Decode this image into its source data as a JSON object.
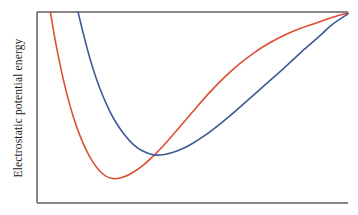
{
  "figure": {
    "background_color": "#ffffff",
    "frame_color": "#878787",
    "frame": {
      "left": 37,
      "top": 12,
      "right": 348,
      "bottom": 203
    },
    "frame_sides_drawn": [
      "left",
      "top",
      "bottom"
    ]
  },
  "axes": {
    "ylabel": "Electrostatic potential energy",
    "ylabel_rotation": -90,
    "xlabel": "",
    "x_tick_labels": [],
    "y_tick_labels": [],
    "grid": false
  },
  "chart_data": {
    "type": "line",
    "title": "",
    "subtitle": "",
    "xlabel": "",
    "ylabel": "Electrostatic potential energy",
    "grid": false,
    "legend": false,
    "legend_position": "none",
    "xlim": [
      0,
      1
    ],
    "ylim": [
      0,
      1
    ],
    "annotations": [],
    "series": [
      {
        "name": "red-curve",
        "color": "#DE4F32",
        "linewidth": 1.6,
        "well_depth_label": "deeper well",
        "well_position_label": "shorter separation",
        "minimum": {
          "x": 0.243,
          "y": 0.128
        },
        "crosses_top_at_x": 0.043,
        "points": [
          {
            "x": 0.043,
            "y": 1.0
          },
          {
            "x": 0.06,
            "y": 0.84
          },
          {
            "x": 0.08,
            "y": 0.68
          },
          {
            "x": 0.1,
            "y": 0.545
          },
          {
            "x": 0.12,
            "y": 0.435
          },
          {
            "x": 0.14,
            "y": 0.345
          },
          {
            "x": 0.16,
            "y": 0.272
          },
          {
            "x": 0.18,
            "y": 0.214
          },
          {
            "x": 0.2,
            "y": 0.17
          },
          {
            "x": 0.22,
            "y": 0.142
          },
          {
            "x": 0.243,
            "y": 0.128
          },
          {
            "x": 0.27,
            "y": 0.132
          },
          {
            "x": 0.3,
            "y": 0.152
          },
          {
            "x": 0.34,
            "y": 0.196
          },
          {
            "x": 0.38,
            "y": 0.256
          },
          {
            "x": 0.42,
            "y": 0.325
          },
          {
            "x": 0.46,
            "y": 0.4
          },
          {
            "x": 0.5,
            "y": 0.476
          },
          {
            "x": 0.55,
            "y": 0.57
          },
          {
            "x": 0.6,
            "y": 0.654
          },
          {
            "x": 0.65,
            "y": 0.727
          },
          {
            "x": 0.7,
            "y": 0.789
          },
          {
            "x": 0.75,
            "y": 0.84
          },
          {
            "x": 0.8,
            "y": 0.882
          },
          {
            "x": 0.85,
            "y": 0.916
          },
          {
            "x": 0.9,
            "y": 0.944
          },
          {
            "x": 0.95,
            "y": 0.972
          },
          {
            "x": 1.0,
            "y": 0.995
          }
        ]
      },
      {
        "name": "blue-curve",
        "color": "#3D5A96",
        "linewidth": 1.6,
        "well_depth_label": "shallower well",
        "well_position_label": "longer separation",
        "minimum": {
          "x": 0.375,
          "y": 0.252
        },
        "crosses_top_at_x": 0.132,
        "points": [
          {
            "x": 0.132,
            "y": 1.0
          },
          {
            "x": 0.15,
            "y": 0.88
          },
          {
            "x": 0.17,
            "y": 0.758
          },
          {
            "x": 0.19,
            "y": 0.655
          },
          {
            "x": 0.21,
            "y": 0.568
          },
          {
            "x": 0.23,
            "y": 0.494
          },
          {
            "x": 0.25,
            "y": 0.432
          },
          {
            "x": 0.28,
            "y": 0.36
          },
          {
            "x": 0.31,
            "y": 0.306
          },
          {
            "x": 0.34,
            "y": 0.272
          },
          {
            "x": 0.375,
            "y": 0.252
          },
          {
            "x": 0.41,
            "y": 0.254
          },
          {
            "x": 0.45,
            "y": 0.272
          },
          {
            "x": 0.49,
            "y": 0.302
          },
          {
            "x": 0.54,
            "y": 0.354
          },
          {
            "x": 0.59,
            "y": 0.416
          },
          {
            "x": 0.64,
            "y": 0.484
          },
          {
            "x": 0.69,
            "y": 0.556
          },
          {
            "x": 0.74,
            "y": 0.628
          },
          {
            "x": 0.79,
            "y": 0.7
          },
          {
            "x": 0.83,
            "y": 0.76
          },
          {
            "x": 0.87,
            "y": 0.82
          },
          {
            "x": 0.91,
            "y": 0.876
          },
          {
            "x": 0.95,
            "y": 0.935
          },
          {
            "x": 1.0,
            "y": 0.99
          }
        ]
      }
    ],
    "crossing_point": {
      "x": 0.337,
      "y": 0.238
    }
  }
}
